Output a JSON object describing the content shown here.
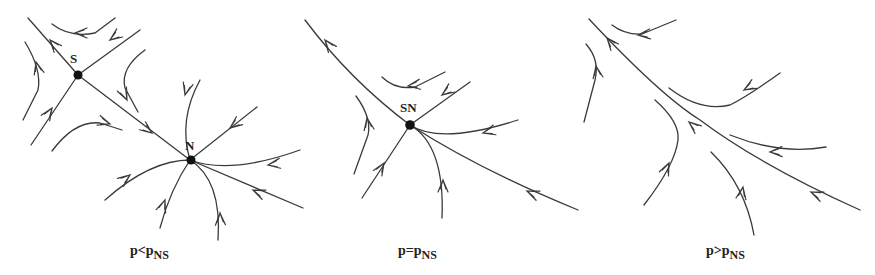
{
  "figure": {
    "panels": [
      {
        "id": "before",
        "caption": {
          "main": "p<p",
          "sub": "NS"
        },
        "fixed_points": [
          {
            "label": "S",
            "type": "saddle"
          },
          {
            "label": "N",
            "type": "stable-node"
          }
        ]
      },
      {
        "id": "at",
        "caption": {
          "main": "p=p",
          "sub": "NS"
        },
        "fixed_points": [
          {
            "label": "SN",
            "type": "saddle-node"
          }
        ]
      },
      {
        "id": "after",
        "caption": {
          "main": "p>p",
          "sub": "NS"
        },
        "fixed_points": []
      }
    ],
    "colors": {
      "line": "#3a3a3a",
      "node": "#111111",
      "background": "#ffffff"
    }
  }
}
